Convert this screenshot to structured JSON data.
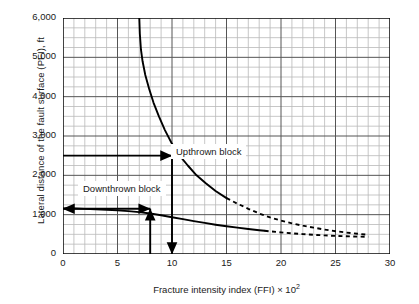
{
  "chart_data": {
    "type": "line",
    "title": "",
    "xlabel": "Fracture intensity index (FFI) × 10",
    "xlabel_exponent": "2",
    "ylabel": "Lateral distance of the fault surface (PFI), ft",
    "xlim": [
      0,
      30
    ],
    "ylim": [
      0,
      6000
    ],
    "xticks": [
      0,
      5,
      10,
      15,
      20,
      25,
      30
    ],
    "xticklabels": [
      "0",
      "5",
      "10",
      "15",
      "20",
      "25",
      "30"
    ],
    "yticks": [
      0,
      1000,
      2000,
      3000,
      4000,
      5000,
      6000
    ],
    "yticklabels": [
      "0",
      "1,000",
      "2,000",
      "3,000",
      "4,000",
      "5,000",
      "6,000"
    ],
    "grid": true,
    "grid_minor_x_step": 1,
    "grid_minor_y_step": 250,
    "grid_major_x_step": 5,
    "grid_major_y_step": 1000,
    "legend": "none",
    "series": [
      {
        "name": "Upthrown block",
        "style": "solid-then-dashed",
        "solid_range": [
          7.0,
          15.0
        ],
        "dashed_range": [
          15.0,
          28.0
        ],
        "points": [
          [
            7.0,
            6000
          ],
          [
            7.05,
            5600
          ],
          [
            7.15,
            5200
          ],
          [
            7.3,
            4900
          ],
          [
            7.55,
            4550
          ],
          [
            7.9,
            4200
          ],
          [
            8.3,
            3850
          ],
          [
            8.8,
            3500
          ],
          [
            9.35,
            3150
          ],
          [
            10.0,
            2800
          ],
          [
            10.7,
            2500
          ],
          [
            11.45,
            2250
          ],
          [
            12.25,
            2000
          ],
          [
            13.1,
            1800
          ],
          [
            14.0,
            1600
          ],
          [
            15.0,
            1420
          ],
          [
            16.0,
            1280
          ],
          [
            17.0,
            1150
          ],
          [
            18.0,
            1030
          ],
          [
            19.0,
            930
          ],
          [
            20.0,
            850
          ],
          [
            21.0,
            780
          ],
          [
            22.0,
            720
          ],
          [
            23.0,
            670
          ],
          [
            24.0,
            620
          ],
          [
            25.0,
            580
          ],
          [
            26.0,
            545
          ],
          [
            27.0,
            515
          ],
          [
            28.0,
            490
          ]
        ]
      },
      {
        "name": "Downthrown block",
        "style": "solid-then-dashed",
        "solid_range": [
          0.0,
          18.5
        ],
        "dashed_range": [
          18.5,
          28.0
        ],
        "points": [
          [
            0.0,
            1160
          ],
          [
            1.0,
            1155
          ],
          [
            2.0,
            1148
          ],
          [
            3.0,
            1138
          ],
          [
            4.0,
            1125
          ],
          [
            5.0,
            1110
          ],
          [
            6.0,
            1090
          ],
          [
            7.0,
            1065
          ],
          [
            8.0,
            1030
          ],
          [
            9.0,
            985
          ],
          [
            10.0,
            935
          ],
          [
            11.0,
            885
          ],
          [
            12.0,
            835
          ],
          [
            13.0,
            790
          ],
          [
            14.0,
            745
          ],
          [
            15.0,
            705
          ],
          [
            16.0,
            670
          ],
          [
            17.0,
            635
          ],
          [
            18.0,
            605
          ],
          [
            18.5,
            590
          ],
          [
            19.0,
            575
          ],
          [
            20.0,
            550
          ],
          [
            21.0,
            525
          ],
          [
            22.0,
            505
          ],
          [
            23.0,
            488
          ],
          [
            24.0,
            473
          ],
          [
            25.0,
            460
          ],
          [
            26.0,
            450
          ],
          [
            27.0,
            442
          ],
          [
            28.0,
            438
          ]
        ]
      }
    ],
    "annotations": [
      {
        "name": "upthrown-block-label",
        "text": "Upthrown block",
        "x": 12.6,
        "y": 2480
      },
      {
        "name": "downthrown-block-label",
        "text": "Downthrown block",
        "x": 4.2,
        "y": 1600
      },
      {
        "name": "upthrown-read-arrow",
        "type": "arrow-horizontal",
        "text": "",
        "from": [
          0,
          2500
        ],
        "to": [
          10,
          2500
        ],
        "heads": "end"
      },
      {
        "name": "downthrown-read-arrow",
        "type": "arrow-horizontal",
        "text": "",
        "from": [
          0,
          1150
        ],
        "to": [
          8,
          1150
        ],
        "heads": "both"
      },
      {
        "name": "downthrown-vertical-arrow",
        "type": "arrow-vertical",
        "text": "",
        "from": [
          8,
          0
        ],
        "to": [
          8,
          1150
        ],
        "heads": "end"
      },
      {
        "name": "upthrown-vertical-arrow",
        "type": "arrow-vertical",
        "text": "",
        "from": [
          10,
          2500
        ],
        "to": [
          10,
          0
        ],
        "heads": "end"
      }
    ],
    "colors": {
      "curve": "#000000",
      "grid_major": "#555555",
      "grid_minor": "#b9b9b9",
      "axis": "#000000",
      "background": "#ffffff"
    }
  }
}
